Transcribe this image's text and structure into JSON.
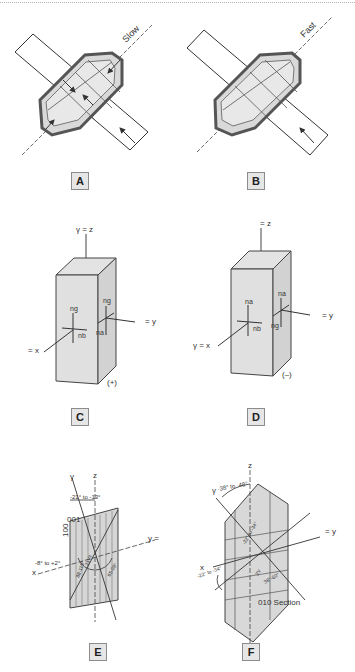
{
  "panels": {
    "A": {
      "label": "A",
      "direction": "Slow"
    },
    "B": {
      "label": "B",
      "direction": "Fast"
    },
    "C": {
      "label": "C",
      "top_axis": "γ = z",
      "left_axis": "= x",
      "right_axis": "= y",
      "n_top_front": "ng",
      "n_right_front": "nb",
      "n_top_side": "ng",
      "n_left_side": "na",
      "sign": "(+)"
    },
    "D": {
      "label": "D",
      "top_axis": "= z",
      "left_axis": "γ = x",
      "right_axis": "= y",
      "n_top_front": "na",
      "n_right_front": "nb",
      "n_top_side": "na",
      "n_left_side": "ng",
      "sign": "(–)"
    },
    "E": {
      "label": "E",
      "z": "z",
      "gamma": "γ",
      "angle_top": "-21° to -13°",
      "face_001": "001",
      "face_100": "100",
      "y": "y =",
      "x": "x",
      "angle_x": "-8° to +2°",
      "arc1": "88-115°",
      "arc2": "21Vz",
      "arc3": "65-98°"
    },
    "F": {
      "label": "F",
      "z": "z",
      "gamma": "γ",
      "angle_top": "-38° to -48°",
      "y": "= y",
      "x": "x",
      "angle_x": "-22° to -34°",
      "arc1": "-22° to -34°",
      "arc2": "2V",
      "arc3": "38°-60°",
      "section": "010 Section"
    }
  }
}
